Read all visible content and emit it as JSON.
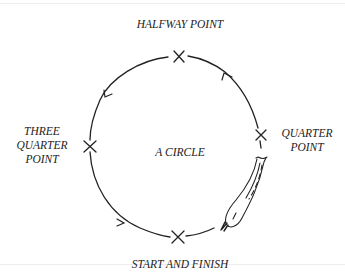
{
  "diagram": {
    "title": "A CIRCLE",
    "points": {
      "halfway": "HALFWAY POINT",
      "quarter": [
        "QUARTER",
        "POINT"
      ],
      "three_quarter": [
        "THREE",
        "QUARTER",
        "POINT"
      ],
      "start_finish": "START AND FINISH"
    },
    "marker": "x-mark",
    "direction": "counterclockwise (start at bottom, up right side)",
    "colors": {
      "ink": "#222222",
      "background": "#ffffff"
    }
  }
}
